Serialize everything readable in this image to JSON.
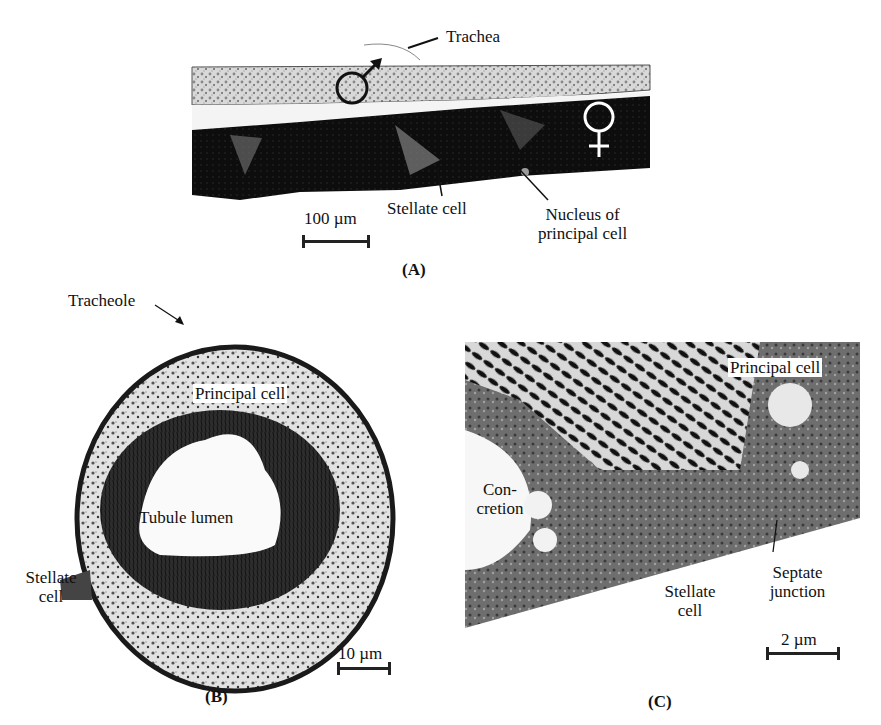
{
  "figure": {
    "panels": [
      {
        "id": "A",
        "caption": "(A)",
        "labels": {
          "trachea": "Trachea",
          "stellate_cell": "Stellate cell",
          "nucleus_line1": "Nucleus of",
          "nucleus_line2": "principal cell",
          "male_symbol": "♂",
          "female_symbol": "♀"
        },
        "scale_bar": "100 µm"
      },
      {
        "id": "B",
        "caption": "(B)",
        "labels": {
          "tracheole": "Tracheole",
          "principal_cell": "Principal cell",
          "tubule_lumen": "Tubule lumen",
          "stellate_line1": "Stellate",
          "stellate_line2": "cell"
        },
        "scale_bar": "10 µm"
      },
      {
        "id": "C",
        "caption": "(C)",
        "labels": {
          "principal_cell": "Principal cell",
          "concretion_line1": "Con-",
          "concretion_line2": "cretion",
          "stellate_line1": "Stellate",
          "stellate_line2": "cell",
          "septate_line1": "Septate",
          "septate_line2": "junction"
        },
        "scale_bar": "2 µm"
      }
    ]
  }
}
